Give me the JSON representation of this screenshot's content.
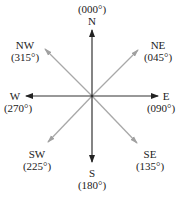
{
  "diagram": {
    "center": {
      "x": 92,
      "y": 96
    },
    "colors": {
      "cardinal_arrow": "#222222",
      "intercardinal_arrow": "#a0a0a0",
      "text": "#222222",
      "background": "#ffffff"
    },
    "directions": [
      {
        "id": "N",
        "label": "N",
        "bearing": "(000°)",
        "type": "cardinal"
      },
      {
        "id": "NE",
        "label": "NE",
        "bearing": "(045°)",
        "type": "intercardinal"
      },
      {
        "id": "E",
        "label": "E",
        "bearing": "(090°)",
        "type": "cardinal"
      },
      {
        "id": "SE",
        "label": "SE",
        "bearing": "(135°)",
        "type": "intercardinal"
      },
      {
        "id": "S",
        "label": "S",
        "bearing": "(180°)",
        "type": "cardinal"
      },
      {
        "id": "SW",
        "label": "SW",
        "bearing": "(225°)",
        "type": "intercardinal"
      },
      {
        "id": "W",
        "label": "W",
        "bearing": "(270°)",
        "type": "cardinal"
      },
      {
        "id": "NW",
        "label": "NW",
        "bearing": "(315°)",
        "type": "intercardinal"
      }
    ]
  }
}
